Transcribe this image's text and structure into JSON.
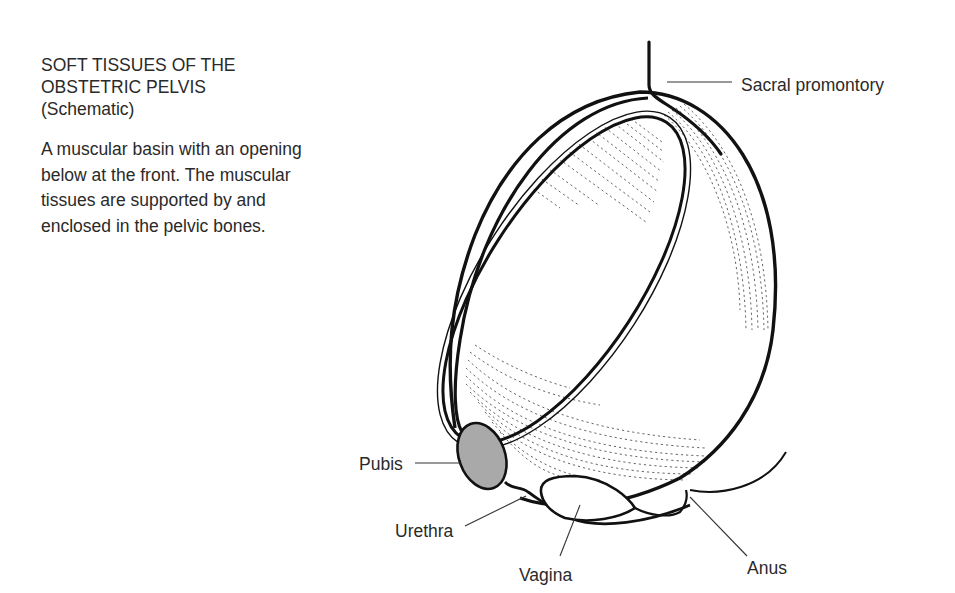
{
  "title": {
    "lines": [
      "SOFT TISSUES OF THE",
      "OBSTETRIC PELVIS",
      "(Schematic)"
    ]
  },
  "description": {
    "lines": [
      "A muscular basin with an opening",
      "below at the front.  The muscular",
      "tissues are supported by and",
      "enclosed in the pelvic bones."
    ]
  },
  "labels": {
    "sacral_promontory": "Sacral promontory",
    "pubis": "Pubis",
    "urethra": "Urethra",
    "vagina": "Vagina",
    "anus": "Anus"
  },
  "colors": {
    "line": "#111111",
    "pubis_fill": "#a9a9a9",
    "text": "#2a2a2a",
    "background": "#ffffff"
  }
}
